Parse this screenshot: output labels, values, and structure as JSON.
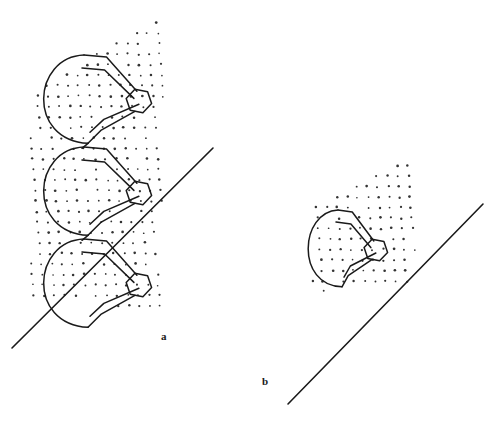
{
  "figure": {
    "type": "line-diagram",
    "background_color": "#ffffff",
    "ink_color": "#1a1a1a",
    "stipple_color": "#333333",
    "panels": [
      {
        "id": "a",
        "label": "a",
        "label_position": {
          "x": 161,
          "y": 331
        },
        "turns": 3,
        "hexagons": 3,
        "stipple_plane": {
          "shape": "quadrilateral",
          "points": "30,95 163,12 163,310 30,300",
          "dot_spacing_x": 10.5,
          "dot_spacing_y": 10.5,
          "dot_radius": 1.1
        },
        "diagonal_line": {
          "x1": 12,
          "y1": 348,
          "x2": 213,
          "y2": 148,
          "width": 1.6
        },
        "coil": {
          "center_x": 78,
          "turn_height": 92,
          "first_turn_top": 55,
          "arc_radius_x": 38,
          "arc_radius_y": 46,
          "ribbon_width": 13,
          "hexagon_radius": 13
        }
      },
      {
        "id": "b",
        "label": "b",
        "label_position": {
          "x": 262,
          "y": 376
        },
        "turns": 1,
        "hexagons": 1,
        "stipple_plane": {
          "shape": "quadrilateral",
          "points": "312,205 415,155 415,282 312,292",
          "dot_spacing_x": 10.5,
          "dot_spacing_y": 10.5,
          "dot_radius": 1.1
        },
        "diagonal_line": {
          "x1": 288,
          "y1": 404,
          "x2": 483,
          "y2": 204,
          "width": 1.6
        },
        "coil": {
          "center_x": 332,
          "turn_height": 80,
          "first_turn_top": 210,
          "arc_radius_x": 27,
          "arc_radius_y": 42,
          "ribbon_width": 12,
          "hexagon_radius": 12
        }
      }
    ]
  }
}
